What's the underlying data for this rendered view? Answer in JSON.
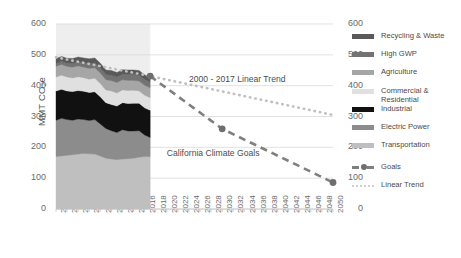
{
  "chart_data": {
    "type": "area",
    "title": "",
    "xlabel": "",
    "ylabel": "MMT CO₂e",
    "ylim": [
      0,
      600
    ],
    "xlim": [
      2000,
      2050
    ],
    "grid": true,
    "legend_position": "right",
    "y_ticks": [
      600,
      500,
      400,
      300,
      200,
      100,
      0
    ],
    "y_ticks_right": [
      600,
      500,
      400,
      300,
      200,
      100,
      0
    ],
    "x_ticks": [
      2000,
      2002,
      2004,
      2006,
      2008,
      2010,
      2012,
      2014,
      2016,
      2018,
      2020,
      2022,
      2024,
      2026,
      2028,
      2030,
      2032,
      2034,
      2036,
      2038,
      2040,
      2042,
      2044,
      2046,
      2048,
      2050
    ],
    "x": [
      2000,
      2001,
      2002,
      2003,
      2004,
      2005,
      2006,
      2007,
      2008,
      2009,
      2010,
      2011,
      2012,
      2013,
      2014,
      2015,
      2016,
      2017
    ],
    "series": [
      {
        "name": "Transportation",
        "color": "#bfbfbf",
        "values": [
          170,
          172,
          174,
          176,
          178,
          180,
          179,
          178,
          172,
          165,
          162,
          160,
          162,
          163,
          165,
          168,
          170,
          170
        ]
      },
      {
        "name": "Electric Power",
        "color": "#8c8c8c",
        "values": [
          118,
          122,
          116,
          112,
          114,
          110,
          108,
          112,
          104,
          96,
          92,
          88,
          95,
          90,
          88,
          86,
          70,
          62
        ]
      },
      {
        "name": "Industrial",
        "color": "#111111",
        "values": [
          95,
          94,
          93,
          93,
          92,
          92,
          91,
          90,
          88,
          84,
          85,
          86,
          88,
          89,
          90,
          89,
          88,
          88
        ]
      },
      {
        "name": "Commercial & Residential",
        "color": "#e0e0e0",
        "values": [
          45,
          46,
          45,
          44,
          45,
          44,
          43,
          44,
          43,
          41,
          44,
          42,
          41,
          42,
          42,
          40,
          41,
          41
        ]
      },
      {
        "name": "Agriculture",
        "color": "#a6a6a6",
        "values": [
          35,
          35,
          34,
          35,
          35,
          34,
          35,
          34,
          34,
          33,
          33,
          34,
          33,
          33,
          32,
          32,
          32,
          32
        ]
      },
      {
        "name": "High GWP",
        "color": "#737373",
        "values": [
          9,
          10,
          11,
          12,
          13,
          14,
          15,
          16,
          16,
          17,
          18,
          18,
          18,
          19,
          19,
          19,
          19,
          19
        ]
      },
      {
        "name": "Recycling & Waste",
        "color": "#595959",
        "values": [
          16,
          16,
          16,
          16,
          16,
          16,
          16,
          16,
          16,
          15,
          15,
          15,
          15,
          15,
          15,
          15,
          15,
          15
        ]
      }
    ],
    "goals": {
      "name": "Goals",
      "color": "#7f7f7f",
      "style": "dashed",
      "points": [
        {
          "x": 2017,
          "y": 431
        },
        {
          "x": 2030,
          "y": 260
        },
        {
          "x": 2050,
          "y": 86
        }
      ]
    },
    "linear_trend": {
      "name": "Linear Trend",
      "color": "#bfbfbf",
      "style": "dotted",
      "points": [
        {
          "x": 2000,
          "y": 492
        },
        {
          "x": 2017,
          "y": 431
        },
        {
          "x": 2050,
          "y": 305
        }
      ]
    },
    "annotations": [
      {
        "text": "2000 - 2017 Linear Trend",
        "x": 2024,
        "y": 420
      },
      {
        "text": "California Climate Goals",
        "x": 2020,
        "y": 180
      }
    ],
    "shaded_band": {
      "from": 2000,
      "to": 2017,
      "color": "#e8e8e8"
    }
  },
  "legend": {
    "items": [
      {
        "label": "Recycling & Waste",
        "color": "#595959",
        "type": "swatch"
      },
      {
        "label": "High GWP",
        "color": "#737373",
        "type": "swatch"
      },
      {
        "label": "Agriculture",
        "color": "#a6a6a6",
        "type": "swatch"
      },
      {
        "label": "Commercial &\nResidential",
        "color": "#e0e0e0",
        "type": "swatch"
      },
      {
        "label": "Industrial",
        "color": "#111111",
        "type": "swatch"
      },
      {
        "label": "Electric Power",
        "color": "#8c8c8c",
        "type": "swatch"
      },
      {
        "label": "Transportation",
        "color": "#bfbfbf",
        "type": "swatch"
      },
      {
        "label": "Goals",
        "color": "#7f7f7f",
        "type": "dashed-marker"
      },
      {
        "label": "Linear Trend",
        "color": "#bfbfbf",
        "type": "dotted"
      }
    ]
  }
}
